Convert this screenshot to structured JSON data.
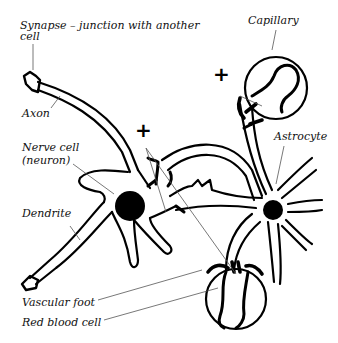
{
  "diagram": {
    "labels": {
      "synapse_line1": "Synapse – junction with another",
      "synapse_line2": "cell",
      "capillary": "Capillary",
      "axon": "Axon",
      "astrocyte": "Astrocyte",
      "nerve_cell_line1": "Nerve cell",
      "nerve_cell_line2": "(neuron)",
      "dendrite": "Dendrite",
      "vascular_foot": "Vascular foot",
      "red_blood_cell": "Red blood cell"
    },
    "markers": {
      "plus_center": "+",
      "plus_top_right": "+"
    },
    "colors": {
      "ink": "#000000",
      "leader_line": "#555555",
      "background": "#ffffff"
    }
  }
}
